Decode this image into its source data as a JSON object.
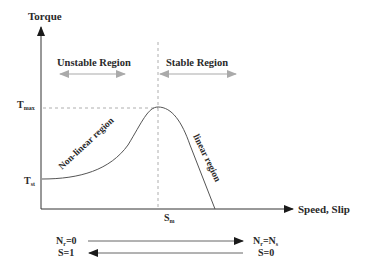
{
  "diagram": {
    "type": "torque-speed characteristic",
    "axes": {
      "y_label": "Torque",
      "x_label": "Speed, Slip"
    },
    "y_ticks": {
      "tmax": {
        "base": "T",
        "sub": "max"
      },
      "tst": {
        "base": "T",
        "sub": "st"
      }
    },
    "x_ticks": {
      "sm": {
        "base": "S",
        "sub": "m"
      }
    },
    "regions": {
      "unstable": "Unstable Region",
      "stable": "Stable Region"
    },
    "curve_labels": {
      "nonlinear": "Non-linear region",
      "linear": "linear region"
    },
    "bottom": {
      "left_top": {
        "base": "N",
        "sub": "r",
        "rest": "=0"
      },
      "left_bottom": "S=1",
      "right_top": {
        "base": "N",
        "sub": "r",
        "eq": "=N",
        "sub2": "s"
      },
      "right_bottom": "S=0"
    },
    "colors": {
      "ink": "#2a2a2a",
      "curve": "#555555",
      "dashed": "#999999",
      "region_arrow": "#aaaaaa"
    }
  }
}
